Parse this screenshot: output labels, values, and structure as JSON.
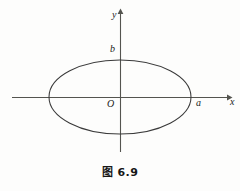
{
  "figure": {
    "caption": "图 6.9",
    "background_color": "#fdfdfc",
    "stroke_color": "#3a3a3a",
    "text_color": "#1a1a1a"
  },
  "axes": {
    "x_axis_label": "x",
    "y_axis_label": "y",
    "origin_label": "O",
    "x_axis": {
      "x_start": 12,
      "x_end": 228,
      "y": 97,
      "arrow": "right"
    },
    "y_axis": {
      "y_start": 12,
      "y_end": 152,
      "x": 120,
      "arrow": "up"
    }
  },
  "annotations": {
    "semi_major_label": "a",
    "semi_minor_label": "b"
  },
  "chart_data": {
    "type": "line",
    "title": "图 6.9",
    "subtitle": "",
    "xlabel": "x",
    "ylabel": "y",
    "grid": false,
    "legend": null,
    "curves": [
      {
        "name": "ellipse",
        "equation": "x^2/a^2 + y^2/b^2 = 1",
        "center": [
          0,
          0
        ],
        "semi_axis_x": "a",
        "semi_axis_y": "b",
        "semi_axis_x_px": 71,
        "semi_axis_y_px": 37,
        "center_px": [
          120,
          97
        ],
        "closed": true,
        "stroke": "#3a3a3a",
        "stroke_width": 1
      }
    ],
    "tick_labels": {
      "x": [
        "a"
      ],
      "y": [
        "b"
      ]
    },
    "origin": "O",
    "xlim": [
      "-a",
      "a"
    ],
    "ylim": [
      "-b",
      "b"
    ],
    "annotations": [
      {
        "text": "a",
        "at": [
          "a",
          0
        ],
        "position": "right-of-vertex"
      },
      {
        "text": "b",
        "at": [
          0,
          "b"
        ],
        "position": "left-of-vertex"
      },
      {
        "text": "O",
        "at": [
          0,
          0
        ],
        "position": "lower-left-of-origin"
      }
    ]
  }
}
